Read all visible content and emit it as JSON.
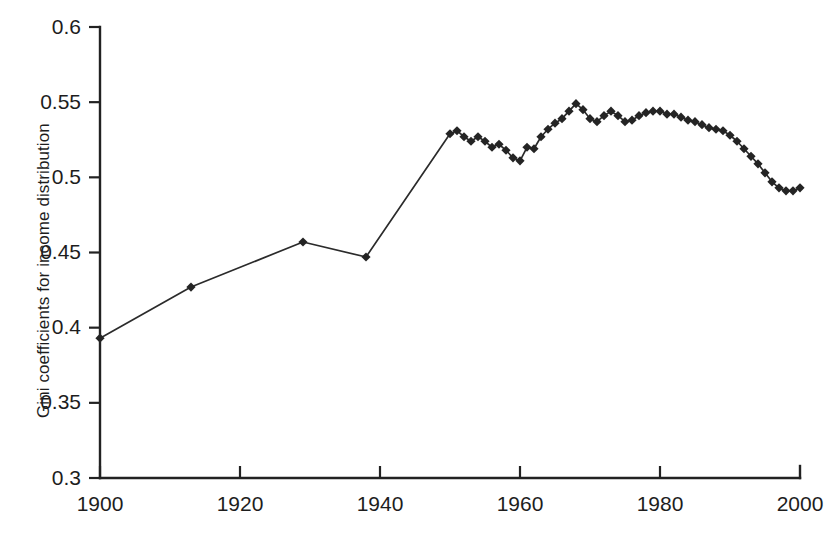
{
  "chart_data": {
    "type": "line",
    "title": "",
    "subtitle": "",
    "xlabel": "",
    "ylabel": "Gini coefficients for income distribution",
    "xlim": [
      1900,
      2000
    ],
    "ylim": [
      0.3,
      0.6
    ],
    "x_ticks": [
      1900,
      1920,
      1940,
      1960,
      1980,
      2000
    ],
    "x_tick_labels": [
      "1900",
      "1920",
      "1940",
      "1960",
      "1980",
      "2000"
    ],
    "y_ticks": [
      0.3,
      0.35,
      0.4,
      0.45,
      0.5,
      0.55,
      0.6
    ],
    "y_tick_labels": [
      "0.3",
      "0.35",
      "0.4",
      "0.45",
      "0.5",
      "0.55",
      "0.6"
    ],
    "grid": false,
    "legend": null,
    "legend_position": "none",
    "marker": "diamond",
    "series": [
      {
        "name": "Gini coefficient",
        "color": "#242424",
        "points": [
          [
            1900,
            0.393
          ],
          [
            1913,
            0.427
          ],
          [
            1929,
            0.457
          ],
          [
            1938,
            0.447
          ],
          [
            1950,
            0.529
          ],
          [
            1951,
            0.531
          ],
          [
            1952,
            0.527
          ],
          [
            1953,
            0.524
          ],
          [
            1954,
            0.527
          ],
          [
            1955,
            0.524
          ],
          [
            1956,
            0.52
          ],
          [
            1957,
            0.522
          ],
          [
            1958,
            0.518
          ],
          [
            1959,
            0.513
          ],
          [
            1960,
            0.511
          ],
          [
            1961,
            0.52
          ],
          [
            1962,
            0.519
          ],
          [
            1963,
            0.527
          ],
          [
            1964,
            0.532
          ],
          [
            1965,
            0.536
          ],
          [
            1966,
            0.539
          ],
          [
            1967,
            0.544
          ],
          [
            1968,
            0.549
          ],
          [
            1969,
            0.545
          ],
          [
            1970,
            0.539
          ],
          [
            1971,
            0.537
          ],
          [
            1972,
            0.541
          ],
          [
            1973,
            0.544
          ],
          [
            1974,
            0.541
          ],
          [
            1975,
            0.537
          ],
          [
            1976,
            0.538
          ],
          [
            1977,
            0.541
          ],
          [
            1978,
            0.543
          ],
          [
            1979,
            0.544
          ],
          [
            1980,
            0.544
          ],
          [
            1981,
            0.542
          ],
          [
            1982,
            0.542
          ],
          [
            1983,
            0.54
          ],
          [
            1984,
            0.538
          ],
          [
            1985,
            0.537
          ],
          [
            1986,
            0.535
          ],
          [
            1987,
            0.533
          ],
          [
            1988,
            0.532
          ],
          [
            1989,
            0.531
          ],
          [
            1990,
            0.528
          ],
          [
            1991,
            0.524
          ],
          [
            1992,
            0.519
          ],
          [
            1993,
            0.514
          ],
          [
            1994,
            0.509
          ],
          [
            1995,
            0.503
          ],
          [
            1996,
            0.497
          ],
          [
            1997,
            0.493
          ],
          [
            1998,
            0.491
          ],
          [
            1999,
            0.491
          ],
          [
            2000,
            0.493
          ]
        ]
      }
    ]
  },
  "axes": {
    "y_axis_name": "y-axis",
    "x_axis_name": "x-axis"
  }
}
